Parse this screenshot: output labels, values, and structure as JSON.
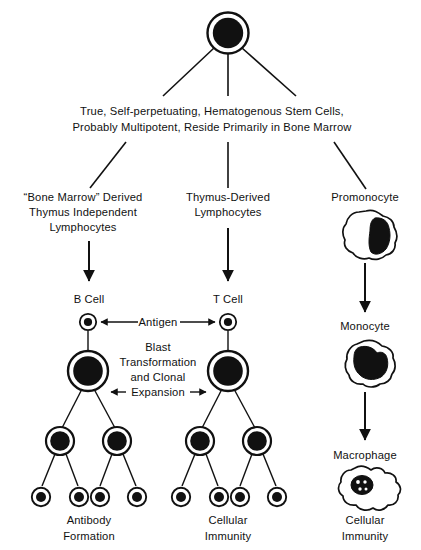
{
  "figure": {
    "background_color": "#ffffff",
    "ink_color": "#111111"
  },
  "nodes": {
    "stem_cell": {
      "name": "stem-cell",
      "caption_line1": "True, Self-perpetuating, Hematogenous Stem Cells,",
      "caption_line2": "Probably Multipotent, Reside Primarily in Bone Marrow"
    },
    "branch_b": {
      "label_line1": "“Bone Marrow” Derived",
      "label_line2": "Thymus Independent",
      "label_line3": "Lymphocytes",
      "cell_label": "B Cell",
      "outcome_line1": "Antibody",
      "outcome_line2": "Formation"
    },
    "branch_t": {
      "label_line1": "Thymus-Derived",
      "label_line2": "Lymphocytes",
      "cell_label": "T Cell",
      "outcome_line1": "Cellular",
      "outcome_line2": "Immunity"
    },
    "branch_m": {
      "label_line1": "Promonocyte",
      "stage2_label": "Monocyte",
      "stage3_label": "Macrophage",
      "outcome_line1": "Cellular",
      "outcome_line2": "Immunity"
    }
  },
  "annotations": {
    "antigen": "Antigen",
    "blast_line1": "Blast",
    "blast_line2": "Transformation",
    "blast_line3": "and  Clonal",
    "blast_line4": "Expansion"
  }
}
